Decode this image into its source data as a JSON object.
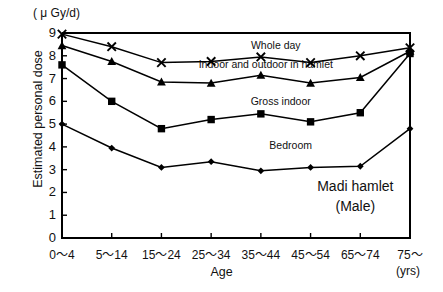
{
  "chart_data": {
    "type": "line",
    "title": "",
    "subtitle": "",
    "unit_label": "( μ Gy/d)",
    "xlabel": "Age",
    "x_unit": "(yrs)",
    "ylabel": "Estimated personal dose",
    "ylim": [
      0,
      9
    ],
    "yticks": [
      "0",
      "1",
      "2",
      "3",
      "4",
      "5",
      "6",
      "7",
      "8",
      "9"
    ],
    "grid": false,
    "legend_position": "inline-labels",
    "categories": [
      "0〜4",
      "5〜14",
      "15〜24",
      "25〜34",
      "35〜44",
      "45〜54",
      "65〜74",
      "75〜"
    ],
    "series": [
      {
        "name": "Whole day",
        "marker": "cross",
        "values": [
          8.95,
          8.4,
          7.7,
          7.75,
          7.95,
          7.7,
          8.0,
          8.35
        ],
        "label_x_category_index": 4.3,
        "label_y": 8.45
      },
      {
        "name": "Indoor and outdoor in hamlet",
        "marker": "triangle",
        "values": [
          8.45,
          7.75,
          6.85,
          6.8,
          7.15,
          6.8,
          7.05,
          8.2
        ],
        "label_x_category_index": 4.1,
        "label_y": 7.6
      },
      {
        "name": "Gross indoor",
        "marker": "square",
        "values": [
          7.6,
          6.0,
          4.8,
          5.2,
          5.45,
          5.1,
          5.5,
          8.1
        ],
        "label_x_category_index": 4.4,
        "label_y": 5.95
      },
      {
        "name": "Bedroom",
        "marker": "diamond",
        "values": [
          5.0,
          3.95,
          3.1,
          3.35,
          2.95,
          3.1,
          3.15,
          4.8
        ],
        "label_x_category_index": 4.6,
        "label_y": 4.05
      }
    ],
    "annotation": {
      "line1": "Madi hamlet",
      "line2": "(Male)"
    }
  }
}
